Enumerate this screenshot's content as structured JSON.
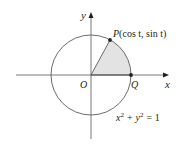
{
  "diagram": {
    "type": "unit-circle",
    "colors": {
      "stroke": "#231f20",
      "circle": "#5a5a5a",
      "sector_fill": "#e3e3e3",
      "background": "#ffffff"
    },
    "axes": {
      "x_label": "x",
      "y_label": "y"
    },
    "origin_label": "O",
    "point_p": {
      "name": "P",
      "coords": "(cos t, sin t)"
    },
    "point_q": {
      "name": "Q"
    },
    "equation": {
      "x_term": "x",
      "plus": "+",
      "y_term": "y",
      "exponent": "2",
      "rhs": "= 1"
    }
  }
}
